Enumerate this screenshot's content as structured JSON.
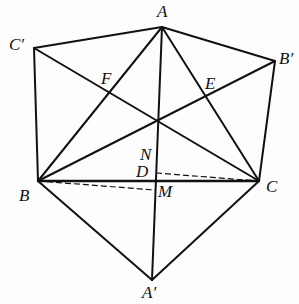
{
  "diagram": {
    "type": "geometry",
    "points": {
      "A": {
        "label": "A",
        "x": 162,
        "y": 27
      },
      "Cp": {
        "label": "C′",
        "x": 34,
        "y": 48
      },
      "Bp": {
        "label": "B′",
        "x": 275,
        "y": 61
      },
      "B": {
        "label": "B",
        "x": 38,
        "y": 181
      },
      "C": {
        "label": "C",
        "x": 259,
        "y": 181
      },
      "Ap": {
        "label": "A′",
        "x": 152,
        "y": 280
      },
      "O": {
        "x": 157,
        "y": 120
      },
      "F": {
        "label": "F",
        "x": 108,
        "y": 93
      },
      "E": {
        "label": "E",
        "x": 206,
        "y": 97
      },
      "N": {
        "label": "N",
        "x": 156,
        "y": 165
      },
      "D": {
        "label": "D",
        "x": 156,
        "y": 173
      },
      "M": {
        "label": "M",
        "x": 155,
        "y": 190
      }
    },
    "solid_segments": [
      [
        "Cp",
        "A"
      ],
      [
        "A",
        "Bp"
      ],
      [
        "Cp",
        "B"
      ],
      [
        "Bp",
        "C"
      ],
      [
        "Cp",
        "C"
      ],
      [
        "Bp",
        "B"
      ],
      [
        "A",
        "B"
      ],
      [
        "A",
        "C"
      ],
      [
        "A",
        "Ap"
      ],
      [
        "B",
        "C"
      ],
      [
        "B",
        "Ap"
      ],
      [
        "C",
        "Ap"
      ]
    ],
    "dashed_segments": [
      [
        "D",
        "C"
      ],
      [
        "B",
        "M"
      ]
    ],
    "labels": {
      "A": "A",
      "Cp": "C′",
      "Bp": "B′",
      "B": "B",
      "C": "C",
      "Ap": "A′",
      "F": "F",
      "E": "E",
      "N": "N",
      "D": "D",
      "M": "M"
    },
    "stroke_color": "#111111"
  }
}
